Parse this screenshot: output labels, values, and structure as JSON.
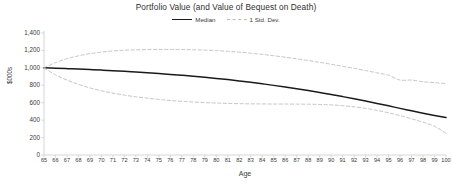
{
  "chart_data": {
    "type": "line",
    "title": "Portfolio Value (and Value of Bequest on Death)",
    "xlabel": "Age",
    "ylabel": "$000s",
    "xlim": [
      65,
      100
    ],
    "ylim": [
      0,
      1400
    ],
    "yticks": [
      0,
      200,
      400,
      600,
      800,
      1000,
      1200,
      1400
    ],
    "ytick_labels": [
      "0",
      "200",
      "400",
      "600",
      "800",
      "1,000",
      "1,200",
      "1,400"
    ],
    "grid": false,
    "legend_position": "top-center",
    "x": [
      65,
      66,
      67,
      68,
      69,
      70,
      71,
      72,
      73,
      74,
      75,
      76,
      77,
      78,
      79,
      80,
      81,
      82,
      83,
      84,
      85,
      86,
      87,
      88,
      89,
      90,
      91,
      92,
      93,
      94,
      95,
      96,
      97,
      98,
      99,
      100
    ],
    "xtick_labels": [
      "65",
      "66",
      "67",
      "68",
      "69",
      "70",
      "71",
      "72",
      "73",
      "74",
      "75",
      "76",
      "77",
      "78",
      "79",
      "80",
      "81",
      "82",
      "83",
      "84",
      "85",
      "86",
      "87",
      "88",
      "89",
      "90",
      "91",
      "92",
      "93",
      "94",
      "95",
      "96",
      "97",
      "98",
      "99",
      "100"
    ],
    "series": [
      {
        "name": "Median",
        "style": "solid",
        "color": "#1a1a1a",
        "values": [
          1000,
          996,
          991,
          986,
          980,
          974,
          967,
          960,
          952,
          944,
          935,
          925,
          915,
          904,
          892,
          879,
          865,
          850,
          834,
          817,
          799,
          780,
          760,
          739,
          717,
          694,
          670,
          645,
          619,
          592,
          564,
          535,
          507,
          480,
          454,
          430
        ]
      },
      {
        "name": "1 Std. Dev. (upper)",
        "style": "dashed",
        "color": "#bdbdbd",
        "values": [
          1000,
          1060,
          1105,
          1138,
          1163,
          1181,
          1194,
          1202,
          1207,
          1210,
          1211,
          1211,
          1210,
          1208,
          1204,
          1198,
          1190,
          1180,
          1168,
          1154,
          1139,
          1122,
          1104,
          1084,
          1063,
          1041,
          1018,
          994,
          969,
          943,
          916,
          860,
          860,
          840,
          830,
          820
        ]
      },
      {
        "name": "1 Std. Dev. (lower)",
        "style": "dashed",
        "color": "#bdbdbd",
        "values": [
          1000,
          920,
          860,
          810,
          770,
          737,
          710,
          687,
          668,
          652,
          638,
          626,
          616,
          608,
          601,
          596,
          592,
          589,
          587,
          586,
          585,
          585,
          584,
          583,
          580,
          575,
          566,
          553,
          535,
          512,
          484,
          452,
          416,
          376,
          330,
          250
        ]
      }
    ],
    "legend": [
      {
        "label": "Median",
        "style": "solid",
        "color": "#1a1a1a"
      },
      {
        "label": "1 Std. Dev.",
        "style": "dashed",
        "color": "#bdbdbd"
      }
    ]
  },
  "axis_color": "#cccccc"
}
